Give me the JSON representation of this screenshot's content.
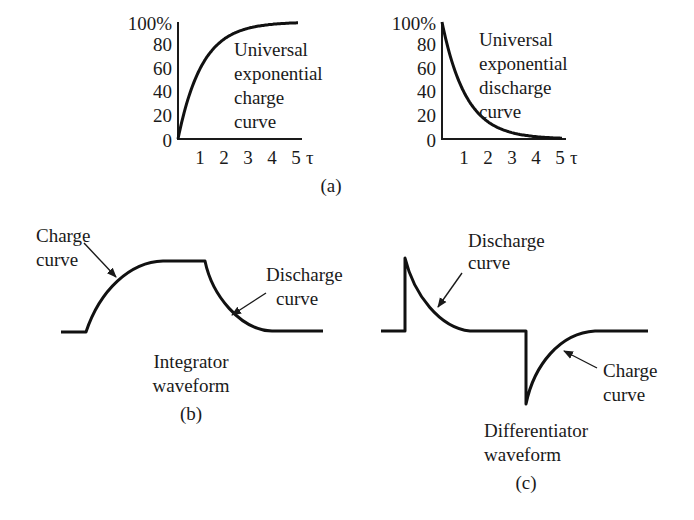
{
  "figure": {
    "panel_a": {
      "label": "(a)",
      "charge_chart": {
        "y_ticks": [
          "100%",
          "80",
          "60",
          "40",
          "20",
          "0"
        ],
        "x_ticks": [
          "1",
          "2",
          "3",
          "4",
          "5"
        ],
        "x_unit": "τ",
        "annotation": [
          "Universal",
          "exponential",
          "charge",
          "curve"
        ]
      },
      "discharge_chart": {
        "y_ticks": [
          "100%",
          "80",
          "60",
          "40",
          "20",
          "0"
        ],
        "x_ticks": [
          "1",
          "2",
          "3",
          "4",
          "5"
        ],
        "x_unit": "τ",
        "annotation": [
          "Universal",
          "exponential",
          "discharge",
          "curve"
        ]
      }
    },
    "panel_b": {
      "label": "(b)",
      "title": [
        "Integrator",
        "waveform"
      ],
      "charge_label": [
        "Charge",
        "curve"
      ],
      "discharge_label": [
        "Discharge",
        "curve"
      ]
    },
    "panel_c": {
      "label": "(c)",
      "title": [
        "Differentiator",
        "waveform"
      ],
      "discharge_label": [
        "Discharge",
        "curve"
      ],
      "charge_label": [
        "Charge",
        "curve"
      ]
    }
  },
  "chart_data": [
    {
      "type": "line",
      "title": "Universal exponential charge curve",
      "xlabel": "τ",
      "ylabel": "%",
      "x": [
        0,
        1,
        2,
        3,
        4,
        5
      ],
      "series": [
        {
          "name": "charge",
          "values": [
            0,
            63,
            86,
            95,
            98,
            99
          ]
        }
      ],
      "xlim": [
        0,
        5
      ],
      "ylim": [
        0,
        100
      ],
      "grid": false
    },
    {
      "type": "line",
      "title": "Universal exponential discharge curve",
      "xlabel": "τ",
      "ylabel": "%",
      "x": [
        0,
        1,
        2,
        3,
        4,
        5
      ],
      "series": [
        {
          "name": "discharge",
          "values": [
            100,
            37,
            14,
            5,
            2,
            1
          ]
        }
      ],
      "xlim": [
        0,
        5
      ],
      "ylim": [
        0,
        100
      ],
      "grid": false
    }
  ]
}
